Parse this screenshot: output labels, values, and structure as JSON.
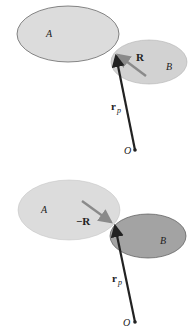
{
  "panels": [
    {
      "body_a_label": "A",
      "body_b_label": "B",
      "vector_r_label": "R",
      "position_vector_label": "r",
      "position_vector_subscript": "p",
      "origin_label": "O"
    },
    {
      "body_a_label": "A",
      "body_b_label": "B",
      "vector_r_label": "−R",
      "position_vector_label": "r",
      "position_vector_subscript": "p",
      "origin_label": "O"
    }
  ],
  "colors": {
    "body_a_fill": "#d9d9d9",
    "body_b_fill_top": "#cfcfcf",
    "body_b_fill_bottom": "#9e9e9e",
    "vector_r": "#8a8a8a",
    "position_vector": "#222222",
    "outline": "#555555"
  }
}
